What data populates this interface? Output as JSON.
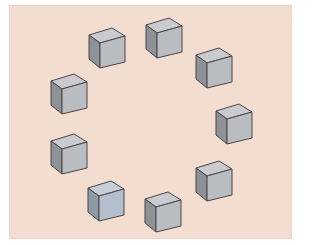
{
  "figure": {
    "background_color": "#f3ddd0",
    "cube_count": 9
  },
  "cubes": [
    {
      "id": 1,
      "x": 88,
      "y": 27,
      "tint": "gray"
    },
    {
      "id": 2,
      "x": 145,
      "y": 17,
      "tint": "gray"
    },
    {
      "id": 3,
      "x": 195,
      "y": 47,
      "tint": "gray"
    },
    {
      "id": 4,
      "x": 215,
      "y": 103,
      "tint": "gray"
    },
    {
      "id": 5,
      "x": 195,
      "y": 160,
      "tint": "gray"
    },
    {
      "id": 6,
      "x": 144,
      "y": 191,
      "tint": "gray"
    },
    {
      "id": 7,
      "x": 87,
      "y": 180,
      "tint": "blue"
    },
    {
      "id": 8,
      "x": 50,
      "y": 133,
      "tint": "gray"
    },
    {
      "id": 9,
      "x": 50,
      "y": 73,
      "tint": "gray"
    }
  ],
  "colors": {
    "gray": {
      "top": "#c9cbce",
      "front": "#b9bcc0",
      "side": "#8e9196",
      "edge": "#4a4646"
    },
    "blue": {
      "top": "#c6ced8",
      "front": "#b3bfcc",
      "side": "#8f99a6",
      "edge": "#4a4646"
    }
  }
}
